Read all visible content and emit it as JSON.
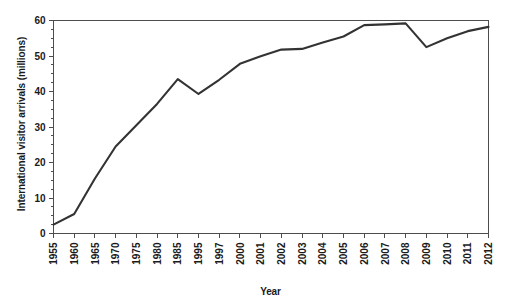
{
  "chart_data": {
    "type": "line",
    "title": "",
    "xlabel": "Year",
    "ylabel": "International visitor arrivals (millions)",
    "categories": [
      "1955",
      "1960",
      "1965",
      "1970",
      "1975",
      "1980",
      "1985",
      "1995",
      "1997",
      "2000",
      "2001",
      "2002",
      "2003",
      "2004",
      "2005",
      "2006",
      "2007",
      "2008",
      "2009",
      "2010",
      "2011",
      "2012"
    ],
    "x": [
      "1955",
      "1960",
      "1965",
      "1970",
      "1975",
      "1980",
      "1985",
      "1995",
      "1997",
      "2000",
      "2001",
      "2002",
      "2003",
      "2004",
      "2005",
      "2006",
      "2007",
      "2008",
      "2009",
      "2010",
      "2011",
      "2012"
    ],
    "values": [
      2.5,
      5.5,
      15.5,
      24.5,
      30.5,
      36.5,
      43.5,
      39.3,
      43.3,
      47.8,
      49.9,
      51.8,
      52.0,
      53.8,
      55.5,
      58.7,
      58.9,
      59.2,
      52.5,
      55.0,
      57.0,
      58.2
    ],
    "series": [
      {
        "name": "International visitor arrivals",
        "values": [
          2.5,
          5.5,
          15.5,
          24.5,
          30.5,
          36.5,
          43.5,
          39.3,
          43.3,
          47.8,
          49.9,
          51.8,
          52.0,
          53.8,
          55.5,
          58.7,
          58.9,
          59.2,
          52.5,
          55.0,
          57.0,
          58.2
        ]
      }
    ],
    "ylim": [
      0,
      60
    ],
    "ytick_labels": [
      "0",
      "10",
      "20",
      "30",
      "40",
      "50",
      "60"
    ],
    "ytick_values": [
      0,
      10,
      20,
      30,
      40,
      50,
      60
    ],
    "yminor_step": 2.5,
    "grid": false,
    "legend": false,
    "legend_position": "none",
    "line_color": "#333333",
    "axis_color": "#4d4d4d",
    "background_color": "#ffffff",
    "annotations": []
  }
}
